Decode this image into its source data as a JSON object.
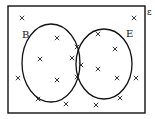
{
  "diagram": {
    "type": "venn",
    "universal_label": "ε",
    "sets": [
      {
        "name": "B",
        "label": "B",
        "cx": 51,
        "cy": 63,
        "rx": 29,
        "ry": 39,
        "label_x": 22,
        "label_y": 38
      },
      {
        "name": "E",
        "label": "E",
        "cx": 104,
        "cy": 64,
        "rx": 28,
        "ry": 35,
        "label_x": 126,
        "label_y": 37
      }
    ],
    "counts": {
      "B_only": 3,
      "B_and_E": 4,
      "E_only": 4,
      "neither": 8,
      "total": 19
    },
    "marker": "×",
    "points": [
      {
        "x": 22,
        "y": 18,
        "region": "neither"
      },
      {
        "x": 134,
        "y": 18,
        "region": "neither"
      },
      {
        "x": 57,
        "y": 38,
        "region": "B_only"
      },
      {
        "x": 40,
        "y": 59,
        "region": "B_only"
      },
      {
        "x": 57,
        "y": 80,
        "region": "B_only"
      },
      {
        "x": 77,
        "y": 47,
        "region": "B_and_E"
      },
      {
        "x": 72,
        "y": 58,
        "region": "B_and_E"
      },
      {
        "x": 81,
        "y": 65,
        "region": "B_and_E"
      },
      {
        "x": 77,
        "y": 77,
        "region": "B_and_E"
      },
      {
        "x": 98,
        "y": 34,
        "region": "E_only"
      },
      {
        "x": 115,
        "y": 49,
        "region": "E_only"
      },
      {
        "x": 98,
        "y": 69,
        "region": "E_only"
      },
      {
        "x": 117,
        "y": 78,
        "region": "E_only"
      },
      {
        "x": 18,
        "y": 78,
        "region": "neither"
      },
      {
        "x": 136,
        "y": 78,
        "region": "neither"
      },
      {
        "x": 38,
        "y": 99,
        "region": "neither"
      },
      {
        "x": 66,
        "y": 104,
        "region": "neither"
      },
      {
        "x": 96,
        "y": 105,
        "region": "neither"
      },
      {
        "x": 120,
        "y": 98,
        "region": "neither"
      }
    ]
  }
}
